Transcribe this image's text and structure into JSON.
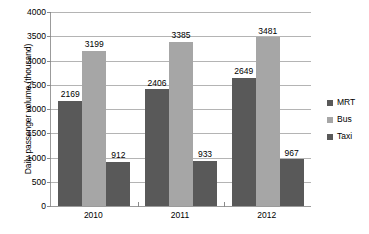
{
  "chart_data": {
    "type": "bar",
    "title": "",
    "xlabel": "",
    "ylabel": "Daily passenger volume (thousand)",
    "categories": [
      "2010",
      "2011",
      "2012"
    ],
    "series": [
      {
        "name": "MRT",
        "values": [
          2169,
          2406,
          2649
        ],
        "color": "#595959"
      },
      {
        "name": "Bus",
        "values": [
          3199,
          3385,
          3481
        ],
        "color": "#a6a6a6"
      },
      {
        "name": "Taxi",
        "values": [
          912,
          933,
          967
        ],
        "color": "#595959"
      }
    ],
    "ylim": [
      0,
      4000
    ],
    "ytick_step": 500,
    "yticks": [
      "0",
      "500",
      "1000",
      "1500",
      "2000",
      "2500",
      "3000",
      "3500",
      "4000"
    ],
    "grid": true,
    "grid_axis": "y",
    "legend_position": "right",
    "data_labels": true
  },
  "axis": {
    "y_title": "Daily passenger volume (thousand)"
  },
  "legend": {
    "items": [
      {
        "label": "MRT",
        "color": "#595959"
      },
      {
        "label": "Bus",
        "color": "#a6a6a6"
      },
      {
        "label": "Taxi",
        "color": "#595959"
      }
    ]
  },
  "colors": {
    "mrt": "#595959",
    "bus": "#a6a6a6",
    "taxi": "#595959",
    "gridline": "#b4b4b4",
    "axis": "#9b9b9b",
    "text": "#000000",
    "background": "#ffffff"
  }
}
